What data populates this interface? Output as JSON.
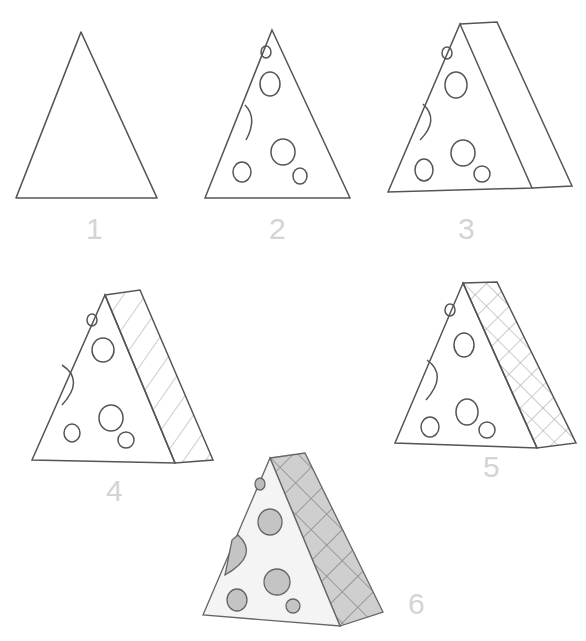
{
  "steps": [
    {
      "number": "1",
      "label_pos": [
        88,
        218
      ]
    },
    {
      "number": "2",
      "label_pos": [
        272,
        218
      ]
    },
    {
      "number": "3",
      "label_pos": [
        460,
        218
      ]
    },
    {
      "number": "4",
      "label_pos": [
        110,
        480
      ]
    },
    {
      "number": "5",
      "label_pos": [
        485,
        455
      ]
    },
    {
      "number": "6",
      "label_pos": [
        410,
        590
      ]
    }
  ],
  "colors": {
    "line": "#555555",
    "label": "#d4d4d4",
    "shade": "#c8c8c8",
    "hole": "#bdbdbd"
  }
}
